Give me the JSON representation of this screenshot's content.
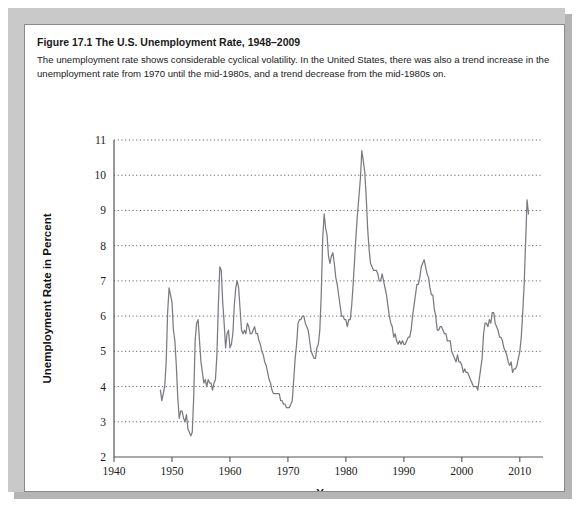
{
  "figure": {
    "number": "Figure 17.1",
    "title": "The U.S. Unemployment Rate, 1948–2009",
    "description": "The unemployment rate shows considerable cyclical volatility. In the United States, there was also a trend increase in the unemployment rate from 1970 until the mid-1980s, and a trend decrease from the mid-1980s on."
  },
  "colors": {
    "line": "#7a7a82",
    "grid": "#4a4a4a",
    "axis": "#555555",
    "panel_background": "#ffffff",
    "frame": "#c9c9c9",
    "text": "#1a1a1a"
  },
  "chart_data": {
    "type": "line",
    "title": "The U.S. Unemployment Rate, 1948–2009",
    "xlabel": "Year",
    "ylabel": "Unemployment Rate in Percent",
    "xlim": [
      1940,
      2014
    ],
    "ylim": [
      2,
      11
    ],
    "xticks": [
      1940,
      1950,
      1960,
      1970,
      1980,
      1990,
      2000,
      2010
    ],
    "xtick_labels": [
      "1940",
      "1950",
      "1960",
      "1970",
      "1980",
      "1990",
      "2000",
      "2010"
    ],
    "yticks": [
      2,
      3,
      4,
      5,
      6,
      7,
      8,
      9,
      10,
      11
    ],
    "ytick_labels": [
      "2",
      "3",
      "4",
      "5",
      "6",
      "7",
      "8",
      "9",
      "10",
      "11"
    ],
    "grid": true,
    "grid_axis": "y",
    "legend": false,
    "series": [
      {
        "name": "U.S. Unemployment Rate",
        "x_start": 1948.0,
        "x_step": 0.25,
        "values": [
          3.9,
          3.6,
          3.8,
          4.0,
          4.7,
          6.1,
          6.8,
          6.6,
          6.4,
          5.6,
          5.3,
          4.6,
          3.7,
          3.1,
          3.3,
          3.3,
          3.1,
          3.0,
          3.2,
          2.8,
          2.7,
          2.6,
          2.7,
          3.7,
          5.3,
          5.8,
          5.9,
          5.3,
          4.7,
          4.4,
          4.1,
          4.2,
          4.0,
          4.2,
          4.1,
          4.1,
          3.9,
          4.1,
          4.2,
          4.9,
          6.3,
          7.4,
          7.3,
          6.4,
          5.8,
          5.1,
          5.5,
          5.6,
          5.1,
          5.2,
          5.5,
          6.3,
          6.8,
          7.0,
          6.8,
          6.2,
          5.6,
          5.5,
          5.6,
          5.5,
          5.8,
          5.7,
          5.5,
          5.5,
          5.6,
          5.7,
          5.5,
          5.5,
          5.3,
          5.2,
          5.0,
          4.9,
          4.7,
          4.6,
          4.4,
          4.2,
          4.1,
          3.9,
          3.8,
          3.8,
          3.8,
          3.8,
          3.8,
          3.6,
          3.6,
          3.5,
          3.5,
          3.4,
          3.4,
          3.4,
          3.5,
          3.6,
          4.2,
          4.8,
          5.2,
          5.8,
          5.9,
          5.9,
          6.0,
          6.0,
          5.8,
          5.7,
          5.6,
          5.3,
          5.0,
          4.9,
          4.8,
          4.8,
          5.1,
          5.2,
          5.6,
          6.6,
          8.2,
          8.9,
          8.5,
          8.3,
          7.7,
          7.5,
          7.7,
          7.8,
          7.5,
          7.1,
          6.9,
          6.6,
          6.3,
          6.0,
          6.0,
          5.9,
          5.9,
          5.7,
          5.9,
          5.9,
          6.3,
          6.9,
          7.6,
          8.3,
          8.9,
          9.4,
          9.9,
          10.7,
          10.4,
          10.1,
          9.4,
          8.5,
          7.9,
          7.5,
          7.4,
          7.3,
          7.3,
          7.3,
          7.2,
          7.0,
          7.0,
          7.2,
          7.0,
          6.8,
          6.6,
          6.3,
          6.0,
          5.8,
          5.7,
          5.4,
          5.5,
          5.3,
          5.2,
          5.3,
          5.2,
          5.3,
          5.2,
          5.2,
          5.3,
          5.4,
          5.4,
          5.6,
          6.0,
          6.3,
          6.6,
          6.9,
          6.9,
          7.1,
          7.4,
          7.5,
          7.6,
          7.4,
          7.2,
          7.1,
          6.8,
          6.6,
          6.6,
          6.2,
          6.0,
          5.6,
          5.6,
          5.7,
          5.7,
          5.6,
          5.5,
          5.5,
          5.3,
          5.3,
          5.3,
          5.0,
          4.9,
          4.8,
          4.7,
          4.9,
          4.7,
          4.7,
          4.6,
          4.4,
          4.5,
          4.4,
          4.4,
          4.3,
          4.2,
          4.1,
          4.0,
          4.0,
          4.0,
          3.9,
          4.2,
          4.5,
          4.8,
          5.5,
          5.8,
          5.8,
          5.7,
          5.9,
          5.8,
          6.1,
          6.1,
          5.8,
          5.7,
          5.6,
          5.4,
          5.4,
          5.3,
          5.1,
          5.0,
          4.9,
          4.7,
          4.6,
          4.7,
          4.4,
          4.5,
          4.5,
          4.6,
          4.8,
          5.0,
          5.4,
          6.1,
          6.9,
          8.1,
          9.3,
          8.9
        ],
        "key_points": [
          {
            "year": 1949.6,
            "value": 7.9,
            "note": "1949 recession peak"
          },
          {
            "year": 1953.4,
            "value": 2.5,
            "note": "Korean War low"
          },
          {
            "year": 1954.7,
            "value": 6.1,
            "note": "1954 recession peak"
          },
          {
            "year": 1958.3,
            "value": 7.5,
            "note": "1958 recession peak"
          },
          {
            "year": 1961.2,
            "value": 7.1,
            "note": "1961 recession peak"
          },
          {
            "year": 1968.9,
            "value": 3.4,
            "note": "late-1960s low"
          },
          {
            "year": 1975.4,
            "value": 9.0,
            "note": "1975 recession peak"
          },
          {
            "year": 1979.4,
            "value": 5.6,
            "note": "late-1970s trough"
          },
          {
            "year": 1982.9,
            "value": 10.8,
            "note": "1982 recession peak"
          },
          {
            "year": 1989.2,
            "value": 5.0,
            "note": "late-1980s trough"
          },
          {
            "year": 1992.5,
            "value": 7.8,
            "note": "1992 recession peak"
          },
          {
            "year": 2000.3,
            "value": 3.9,
            "note": "2000 low"
          },
          {
            "year": 2003.4,
            "value": 6.3,
            "note": "2003 peak"
          },
          {
            "year": 2006.9,
            "value": 4.4,
            "note": "2006 low"
          },
          {
            "year": 2009.7,
            "value": 9.3,
            "note": "Great Recession peak"
          }
        ]
      }
    ]
  }
}
